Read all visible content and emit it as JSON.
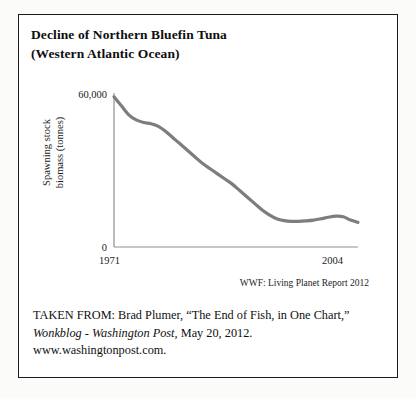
{
  "card": {
    "title_lines": [
      "Decline of Northern Bluefin Tuna",
      "(Western Atlantic Ocean)"
    ],
    "chart_source": "WWF: Living Planet Report 2012",
    "credit": {
      "line1": "TAKEN FROM: Brad Plumer, “The End of Fish, in One Chart,”",
      "line2_italic": "Wonkblog - Washington Post",
      "line2_rest": ", May 20, 2012.",
      "line3": "www.washingtonpost.com."
    }
  },
  "chart_data": {
    "type": "line",
    "title": "Decline of Northern Bluefin Tuna (Western Atlantic Ocean)",
    "xlabel": "",
    "ylabel": "Spawning stock biomass (tonnes)",
    "ylabel_line1": "Spawning stock",
    "ylabel_line2": "biomass (tonnes)",
    "xlim": [
      1971,
      2004
    ],
    "ylim": [
      0,
      60000
    ],
    "ytick_labels": [
      "60,000",
      "0"
    ],
    "ytick_values": [
      60000,
      0
    ],
    "xtick_labels": [
      "1971",
      "2004"
    ],
    "xtick_values": [
      1971,
      2004
    ],
    "grid": false,
    "legend": false,
    "line_color": "#7d7d7d",
    "line_width_px": 3.2,
    "axis_color": "#8c8c8c",
    "series": [
      {
        "name": "Spawning stock biomass",
        "x": [
          1971,
          1972,
          1973,
          1974,
          1975,
          1976,
          1977,
          1978,
          1979,
          1980,
          1981,
          1982,
          1983,
          1984,
          1985,
          1986,
          1987,
          1988,
          1989,
          1990,
          1991,
          1992,
          1993,
          1994,
          1995,
          1996,
          1997,
          1998,
          1999,
          2000,
          2001,
          2002,
          2003,
          2004
        ],
        "values": [
          58500,
          55000,
          51500,
          49500,
          48500,
          48000,
          47000,
          45000,
          42500,
          40000,
          37500,
          35000,
          32500,
          30500,
          28500,
          26500,
          24500,
          22000,
          19500,
          17000,
          14500,
          12500,
          11000,
          10300,
          10000,
          10000,
          10200,
          10500,
          11000,
          11600,
          12000,
          11800,
          10500,
          9600
        ]
      }
    ]
  }
}
